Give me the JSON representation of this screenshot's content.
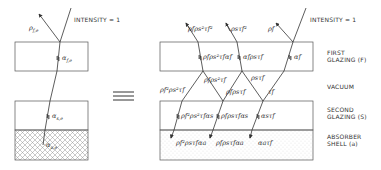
{
  "left_diagram": {
    "intensity_label": "INTENSITY = 1",
    "reflect_label": "ρ",
    "reflect_sub": "f,e",
    "alpha_f_label": "α",
    "alpha_f_sub": "f,e",
    "alpha_s_label": "α",
    "alpha_s_sub": "s,e",
    "alpha_a_label": "α",
    "alpha_a_sub": "a,e"
  },
  "equivalence_symbol": "≡",
  "right_diagram": {
    "intensity_label": "INTENSITY = 1",
    "top_labels": [
      {
        "base": "ρ",
        "text": "ρfρs²τf²"
      },
      {
        "base": "ρ",
        "text": "ρsτf²"
      },
      {
        "base": "ρ",
        "text": "ρf"
      }
    ],
    "first_glazing_labels": [
      "ρfρs²τfαf",
      "αfρsτf",
      "αf"
    ],
    "vacuum_labels": [
      "ρf²ρs²τf",
      "ρfρs²τf",
      "ρsτf",
      "ρfρsτf",
      "τf"
    ],
    "second_glazing_labels": [
      "ρf²ρs²τfαs",
      "ρfρsτfαs",
      "αsτf"
    ],
    "absorber_labels": [
      "ρf²ρsτfαa",
      "ρfρsτfαa",
      "αaτf"
    ]
  },
  "layer_labels": {
    "first_glazing": [
      "FIRST",
      "GLAZING (F)"
    ],
    "vacuum": [
      "VACUUM"
    ],
    "second_glazing": [
      "SECOND",
      "GLAZING (S)"
    ],
    "absorber": [
      "ABSORBER",
      "SHELL (a)"
    ]
  },
  "colors": {
    "line": "#333333",
    "background": "#ffffff",
    "hatch": "#888888"
  }
}
